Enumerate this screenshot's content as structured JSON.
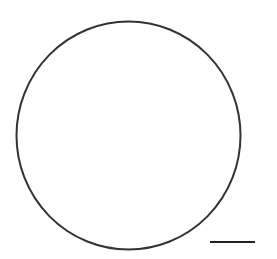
{
  "diagram": {
    "shapes": [
      {
        "type": "circle",
        "cx": 128.5,
        "cy": 135.5,
        "rx": 112,
        "ry": 114,
        "stroke": "#333333",
        "stroke_width": 2,
        "fill": "none"
      }
    ],
    "scale_bar": {
      "x1": 210,
      "x2": 255,
      "y": 242,
      "stroke": "#222222",
      "stroke_width": 2
    }
  },
  "colors": {
    "background": "#ffffff",
    "stroke": "#333333"
  }
}
